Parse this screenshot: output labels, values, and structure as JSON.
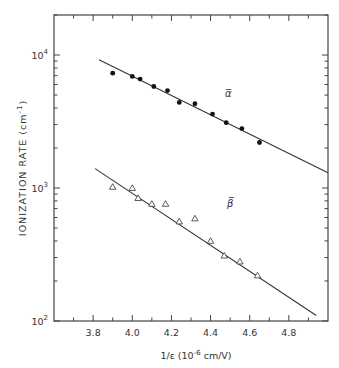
{
  "chart_data": {
    "type": "scatter",
    "title": "",
    "xlabel": "1/ε (10⁻⁶ cm/V)",
    "xlabel_parts": {
      "main": "1/ε (10",
      "exp": "-6",
      "rest": " cm/V)"
    },
    "ylabel": "IONIZATION RATE (cm⁻¹)",
    "ylabel_parts": {
      "main": "IONIZATION  RATE (cm",
      "exp": "-1",
      "rest": ")"
    },
    "yscale": "log",
    "xlim": [
      3.6,
      5.0
    ],
    "ylim": [
      100,
      20000
    ],
    "x_ticks": [
      "3.8",
      "4.0",
      "4.2",
      "4.4",
      "4.6",
      "4.8"
    ],
    "y_ticks": [
      {
        "base": "10",
        "exp": "2",
        "value": 100
      },
      {
        "base": "10",
        "exp": "3",
        "value": 1000
      },
      {
        "base": "10",
        "exp": "4",
        "value": 10000
      }
    ],
    "grid": false,
    "legend": "inline labels",
    "series": [
      {
        "name": "ᾱ",
        "label": "α̅",
        "marker": "filled-circle",
        "x": [
          3.9,
          4.0,
          4.04,
          4.11,
          4.18,
          4.24,
          4.32,
          4.41,
          4.48,
          4.56,
          4.65
        ],
        "y": [
          7300,
          6900,
          6600,
          5800,
          5400,
          4400,
          4300,
          3600,
          3100,
          2800,
          2200
        ],
        "fit_line": {
          "x": [
            3.83,
            5.0
          ],
          "y": [
            9200,
            1300
          ]
        },
        "label_position": {
          "x": 4.49,
          "y": 4800
        }
      },
      {
        "name": "β̅",
        "label": "β̅",
        "marker": "open-triangle",
        "x": [
          3.9,
          4.0,
          4.03,
          4.1,
          4.17,
          4.24,
          4.32,
          4.4,
          4.47,
          4.55,
          4.64
        ],
        "y": [
          1020,
          1000,
          840,
          760,
          760,
          560,
          590,
          400,
          310,
          280,
          220
        ],
        "fit_line": {
          "x": [
            3.81,
            4.94
          ],
          "y": [
            1400,
            110
          ]
        },
        "label_position": {
          "x": 4.5,
          "y": 720
        }
      }
    ]
  }
}
